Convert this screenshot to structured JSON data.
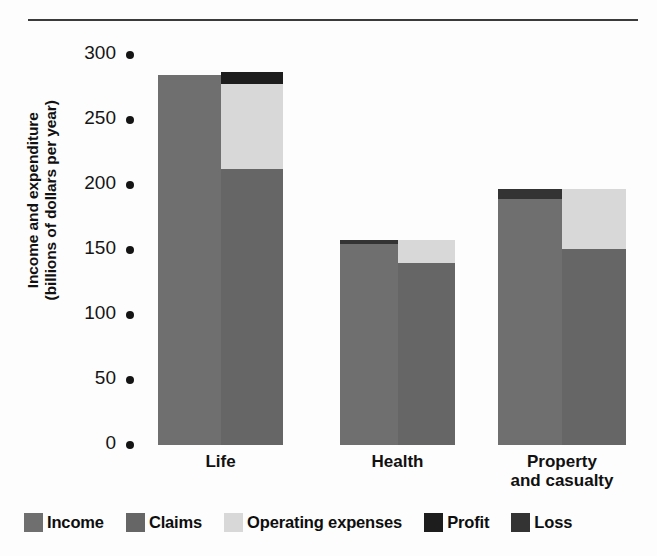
{
  "figure": {
    "top_rule": true,
    "background": "#fdfdfd"
  },
  "axis": {
    "y_title_line1": "Income and expenditure",
    "y_title_line2": "(billions of dollars per year)",
    "y_ticks": [
      "300",
      "250",
      "200",
      "150",
      "100",
      "50",
      "0"
    ],
    "tick_marker": "dot-marker"
  },
  "legend": {
    "items": [
      {
        "label": "Income",
        "color": "#6f6f6f",
        "key": "income"
      },
      {
        "label": "Claims",
        "color": "#666666",
        "key": "claims"
      },
      {
        "label": "Operating expenses",
        "color": "#d8d8d8",
        "key": "operating_expenses"
      },
      {
        "label": "Profit",
        "color": "#1d1d1d",
        "key": "profit"
      },
      {
        "label": "Loss",
        "color": "#333333",
        "key": "loss"
      }
    ]
  },
  "categories": [
    {
      "label_line1": "Life",
      "label_line2": ""
    },
    {
      "label_line1": "Health",
      "label_line2": ""
    },
    {
      "label_line1": "Property",
      "label_line2": "and casualty"
    }
  ],
  "chart_data": {
    "type": "bar",
    "title": "",
    "subtitle": "",
    "xlabel": "",
    "ylabel": "Income and expenditure (billions of dollars per year)",
    "ylim": [
      0,
      300
    ],
    "yticks": [
      0,
      50,
      100,
      150,
      200,
      250,
      300
    ],
    "grid": false,
    "legend_position": "bottom",
    "stacked": true,
    "paired_columns": true,
    "categories": [
      "Life",
      "Health",
      "Property and casualty"
    ],
    "series": [
      {
        "name": "Income",
        "column": "left",
        "values": [
          285,
          155,
          189
        ]
      },
      {
        "name": "Loss",
        "column": "left",
        "values": [
          0,
          3,
          8
        ]
      },
      {
        "name": "Claims",
        "column": "right",
        "values": [
          212,
          140,
          151
        ]
      },
      {
        "name": "Operating expenses",
        "column": "right",
        "values": [
          66,
          18,
          46
        ]
      },
      {
        "name": "Profit",
        "column": "right",
        "values": [
          9,
          0,
          0
        ]
      }
    ],
    "columns": {
      "left": {
        "label": "Income",
        "stack": [
          "Income",
          "Loss"
        ]
      },
      "right": {
        "label": "Expenditure",
        "stack": [
          "Claims",
          "Operating expenses",
          "Profit"
        ]
      }
    }
  }
}
